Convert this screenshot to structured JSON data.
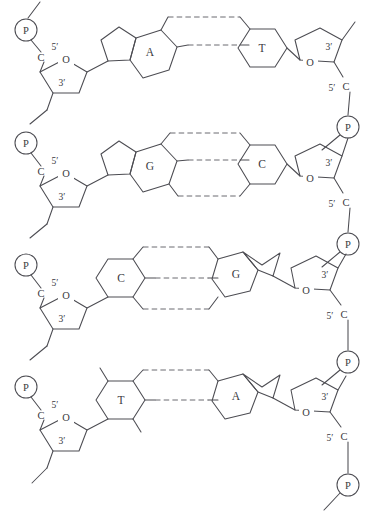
{
  "figure": {
    "width": 374,
    "height": 522,
    "background": "#ffffff",
    "line_color": "#4c4c52",
    "hbond_color": "#6a6a70",
    "text_color": "#3a3a40"
  },
  "labels": {
    "phosphate": "P",
    "oxygen": "O",
    "carbon": "C",
    "five_prime": "5′",
    "three_prime": "3′"
  },
  "base_pairs": [
    {
      "row": 1,
      "left_base": "A",
      "left_type": "purine",
      "right_base": "T",
      "right_type": "pyrimidine",
      "hydrogen_bonds": 2
    },
    {
      "row": 2,
      "left_base": "G",
      "left_type": "purine",
      "right_base": "C",
      "right_type": "pyrimidine",
      "hydrogen_bonds": 3
    },
    {
      "row": 3,
      "left_base": "C",
      "left_type": "pyrimidine",
      "right_base": "G",
      "right_type": "purine",
      "hydrogen_bonds": 3
    },
    {
      "row": 4,
      "left_base": "T",
      "left_type": "pyrimidine",
      "right_base": "A",
      "right_type": "purine",
      "hydrogen_bonds": 2
    }
  ],
  "left_strand": {
    "phosphate_labels": [
      "P",
      "P",
      "P",
      "P"
    ],
    "sugar_labels": [
      {
        "o": "O",
        "c": "C",
        "five": "5′",
        "three": "3′"
      },
      {
        "o": "O",
        "c": "C",
        "five": "5′",
        "three": "3′"
      },
      {
        "o": "O",
        "c": "C",
        "five": "5′",
        "three": "3′"
      },
      {
        "o": "O",
        "c": "C",
        "five": "5′",
        "three": "3′"
      }
    ]
  },
  "right_strand": {
    "phosphate_labels": [
      "P",
      "P",
      "P",
      "P"
    ],
    "sugar_labels": [
      {
        "o": "O",
        "c": "C",
        "five": "5′",
        "three": "3′"
      },
      {
        "o": "O",
        "c": "C",
        "five": "5′",
        "three": "3′"
      },
      {
        "o": "O",
        "c": "C",
        "five": "5′",
        "three": "3′"
      },
      {
        "o": "O",
        "c": "C",
        "five": "5′",
        "three": "3′"
      }
    ]
  }
}
